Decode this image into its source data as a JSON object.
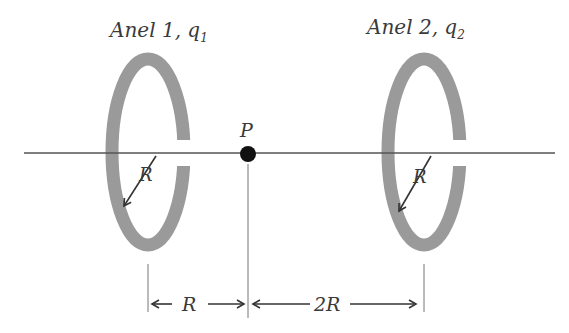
{
  "diagram": {
    "ring1": {
      "title": "Anel 1, ",
      "charge": "q",
      "charge_sub": "1",
      "radius_label": "R"
    },
    "ring2": {
      "title": "Anel 2, ",
      "charge": "q",
      "charge_sub": "2",
      "radius_label": "R"
    },
    "point": {
      "label": "P"
    },
    "dimensions": {
      "left_span": "R",
      "right_span": "2R"
    },
    "colors": {
      "ring": "#999999",
      "line": "#444444",
      "point": "#111111"
    }
  }
}
